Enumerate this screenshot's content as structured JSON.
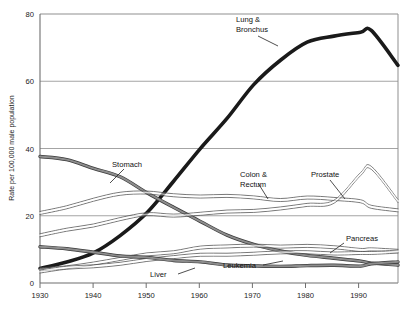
{
  "chart_data": {
    "type": "line",
    "title": "",
    "subtitle": "",
    "xlabel": "",
    "ylabel": "Rate per 100,000 male population",
    "xlim": [
      1930,
      1997
    ],
    "ylim": [
      0,
      80
    ],
    "yticks": [
      0,
      20,
      40,
      60,
      80
    ],
    "ytick_labels": [
      "0",
      "20",
      "40",
      "60",
      "80"
    ],
    "xticks": [
      1930,
      1940,
      1950,
      1960,
      1970,
      1980,
      1990
    ],
    "xtick_labels": [
      "1930",
      "1940",
      "1950",
      "1960",
      "1970",
      "1980",
      "1990"
    ],
    "grid": "horizontal",
    "legend_position": "inline-annotations",
    "x": [
      1930,
      1935,
      1940,
      1945,
      1950,
      1955,
      1960,
      1965,
      1970,
      1975,
      1980,
      1985,
      1990,
      1992,
      1997
    ],
    "series": [
      {
        "name": "Lung & Bronchus",
        "label": "Lung &\nBronchus",
        "style": "thick-black",
        "values": [
          4.5,
          6.0,
          9.0,
          14.0,
          21.0,
          30.0,
          40.0,
          49.0,
          59.0,
          66.0,
          71.5,
          73.5,
          74.5,
          75.0,
          65.0
        ]
      },
      {
        "name": "Stomach",
        "label": "Stomach",
        "style": "thick-gray",
        "values": [
          38.0,
          36.5,
          34.0,
          31.5,
          27.0,
          22.5,
          18.5,
          14.5,
          11.5,
          9.5,
          8.0,
          7.0,
          6.3,
          6.0,
          5.5
        ]
      },
      {
        "name": "Colon & Rectum",
        "label": "Colon &\nRectum",
        "style": "thin-double",
        "values": [
          20.5,
          22.5,
          24.5,
          26.5,
          27.0,
          26.5,
          26.0,
          25.5,
          25.5,
          25.0,
          25.2,
          25.0,
          24.0,
          23.0,
          21.5
        ]
      },
      {
        "name": "Prostate",
        "label": "Prostate",
        "style": "thin-double",
        "values": [
          14.0,
          16.0,
          17.5,
          19.0,
          20.5,
          20.0,
          21.0,
          21.0,
          21.5,
          22.0,
          23.0,
          24.5,
          32.0,
          34.0,
          24.0
        ]
      },
      {
        "name": "Pancreas",
        "label": "Pancreas",
        "style": "thin-double",
        "values": [
          4.0,
          5.0,
          6.0,
          7.2,
          8.5,
          9.5,
          10.2,
          10.8,
          11.2,
          11.0,
          10.8,
          10.5,
          10.2,
          10.0,
          9.8
        ]
      },
      {
        "name": "Leukemia",
        "label": "Leukemia",
        "style": "thin-double",
        "values": [
          3.5,
          4.2,
          5.0,
          5.8,
          6.8,
          7.6,
          8.2,
          8.5,
          8.8,
          8.8,
          8.9,
          9.0,
          9.2,
          9.2,
          9.3
        ]
      },
      {
        "name": "Liver",
        "label": "Liver",
        "style": "thick-gray",
        "values": [
          11.0,
          10.0,
          9.0,
          8.2,
          7.5,
          7.0,
          6.2,
          5.6,
          5.2,
          5.0,
          4.9,
          5.0,
          5.2,
          5.4,
          6.0
        ]
      }
    ],
    "annotations": [
      {
        "text": "Lung & Bronchus",
        "series": "Lung & Bronchus"
      },
      {
        "text": "Stomach",
        "series": "Stomach"
      },
      {
        "text": "Colon & Rectum",
        "series": "Colon & Rectum"
      },
      {
        "text": "Prostate",
        "series": "Prostate"
      },
      {
        "text": "Pancreas",
        "series": "Pancreas"
      },
      {
        "text": "Leukemia",
        "series": "Leukemia"
      },
      {
        "text": "Liver",
        "series": "Liver"
      }
    ],
    "colors": {
      "plot_background": "#ffffff",
      "axis": "#6e6e6e",
      "grid": "#9a9a9a",
      "text": "#111111",
      "lung_line": "#1a1a1a",
      "gray_band": "#8d8d8d",
      "thin_line": "#555555"
    }
  },
  "labels": {
    "y_axis_title": "Rate per 100,000 male population",
    "lung_line1": "Lung &",
    "lung_line2": "Bronchus",
    "stomach": "Stomach",
    "colon_line1": "Colon &",
    "colon_line2": "Rectum",
    "prostate": "Prostate",
    "pancreas": "Pancreas",
    "leukemia": "Leukemia",
    "liver": "Liver",
    "y0": "0",
    "y20": "20",
    "y40": "40",
    "y60": "60",
    "y80": "80",
    "x1930": "1930",
    "x1940": "1940",
    "x1950": "1950",
    "x1960": "1960",
    "x1970": "1970",
    "x1980": "1980",
    "x1990": "1990"
  }
}
